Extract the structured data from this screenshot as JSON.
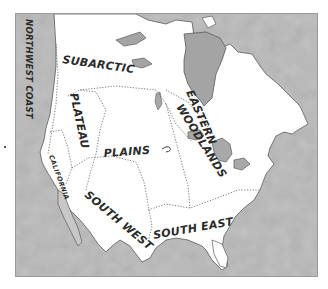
{
  "map": {
    "title": "Native American Culture Areas of North America",
    "regions": [
      {
        "id": "northwest-coast",
        "label": "NORTHWEST COAST"
      },
      {
        "id": "subarctic",
        "label": "SUBARCTIC"
      },
      {
        "id": "plateau",
        "label": "PLATEAU"
      },
      {
        "id": "plains",
        "label": "PLAINS"
      },
      {
        "id": "eastern-woodlands",
        "label_line1": "EASTERN",
        "label_line2": "WOODLANDS"
      },
      {
        "id": "california",
        "label": "CALIFORNIA"
      },
      {
        "id": "south-west",
        "label": "SOUTH WEST"
      },
      {
        "id": "south-east",
        "label": "SOUTH EAST"
      }
    ],
    "colors": {
      "land": "#ffffff",
      "water": "#b9b9b9",
      "water_dark": "#9e9e9e",
      "lake": "#a8a8a8",
      "border_line": "#555555",
      "label": "#2a2a2a"
    }
  }
}
